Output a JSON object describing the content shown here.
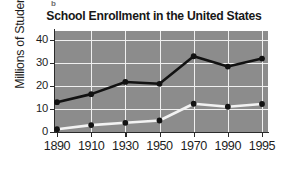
{
  "figure": {
    "panel_label": "b"
  },
  "chart_data": {
    "type": "line",
    "title": "School Enrollment in the United States",
    "xlabel": "",
    "ylabel": "Millions of Students",
    "categories": [
      "1890",
      "1910",
      "1930",
      "1950",
      "1970",
      "1990",
      "1995"
    ],
    "x_tick_labels": [
      "1890",
      "1910",
      "1930",
      "1950",
      "1970",
      "1990",
      "1995"
    ],
    "y_tick_labels": [
      "0",
      "10",
      "20",
      "30",
      "40"
    ],
    "y_ticks": [
      0,
      10,
      20,
      30,
      40
    ],
    "ylim": [
      0,
      44
    ],
    "grid": true,
    "grid_color": "#f0f0f0",
    "plot_background": "#8c8c8c",
    "legend": "none",
    "series": [
      {
        "name": "upper-series",
        "line_color": "#121212",
        "marker_color": "#121212",
        "values": [
          13,
          16.5,
          21.8,
          21,
          33,
          28.5,
          32
        ]
      },
      {
        "name": "lower-series",
        "line_color": "#f2f2f2",
        "marker_color": "#121212",
        "values": [
          1.2,
          3,
          4,
          5,
          12.3,
          11,
          12.2
        ]
      }
    ]
  }
}
